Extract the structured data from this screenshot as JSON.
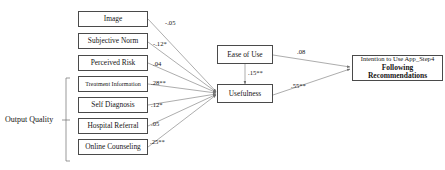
{
  "diagram": {
    "group_label": "Output Quality",
    "nodes": {
      "image": "Image",
      "subjective_norm": "Subjective Norm",
      "perceived_risk": "Perceived Risk",
      "treatment_information": "Treatment Information",
      "self_diagnosis": "Self Diagnosis",
      "hospital_referral": "Hospital Referral",
      "online_counseling": "Online Counseling",
      "ease_of_use": "Ease of Use",
      "usefulness": "Usefulness",
      "intention_line1": "Intention to Use App_Step4",
      "intention_line2": "Following Recommendations"
    },
    "coefficients": {
      "image_to_usefulness": "-.05",
      "subjective_norm_to_usefulness": "-.12*",
      "perceived_risk_to_usefulness": ".04",
      "treatment_information_to_usefulness": ".28**",
      "self_diagnosis_to_usefulness": ".12*",
      "hospital_referral_to_usefulness": ".05",
      "online_counseling_to_usefulness": ".25**",
      "ease_of_use_to_intention": ".08",
      "ease_of_use_to_usefulness": ".15**",
      "usefulness_to_intention": ".55**"
    },
    "colors": {
      "box_border": "#4a4a4a",
      "path_line": "#7a7a7a",
      "text": "#161616",
      "background": "#ffffff"
    }
  }
}
